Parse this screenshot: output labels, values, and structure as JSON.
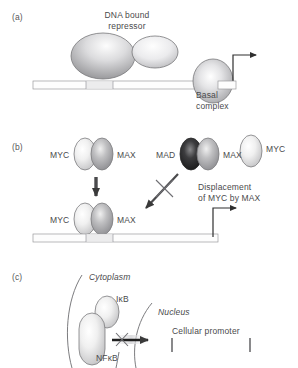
{
  "figure": {
    "panels": [
      {
        "id": "a",
        "label": "(a)",
        "title": "DNA bound\nrepressor",
        "title_line1": "DNA bound",
        "title_line2": "repressor",
        "basal_line1": "Basal",
        "basal_line2": "complex",
        "description": "DNA bound repressor blocking transcription at basal complex"
      },
      {
        "id": "b",
        "label": "(b)",
        "top_left_dimer": {
          "left_label": "MYC",
          "right_label": "MAX"
        },
        "top_right_dimer": {
          "left_label": "MAD",
          "right_label": "MAX"
        },
        "free_monomer": {
          "label": "MYC"
        },
        "bound_dimer": {
          "left_label": "MYC",
          "right_label": "MAX"
        },
        "annotation_line1": "Displacement",
        "annotation_line2": "of MYC by MAX",
        "description": "MYC/MAX dimer binds DNA; MAD/MAX displaces MYC"
      },
      {
        "id": "c",
        "label": "(c)",
        "cytoplasm_label": "Cytoplasm",
        "nucleus_label": "Nucleus",
        "ikb_label": "IκB",
        "nfkb_label": "NFκB",
        "promoter_label": "Cellular promoter",
        "description": "NFkB held in cytoplasm by IkB, blocked from entering nucleus"
      }
    ],
    "colors": {
      "text": "#4a4a4c",
      "outline": "#6d6d70",
      "dna_bar": "#fefefe",
      "dna_site": "#ededed",
      "oval_light": "#f2f2f2",
      "oval_mid": "#b9b9bb",
      "oval_dark": "#1f1f1f",
      "arrow": "#3a3a3a"
    }
  }
}
